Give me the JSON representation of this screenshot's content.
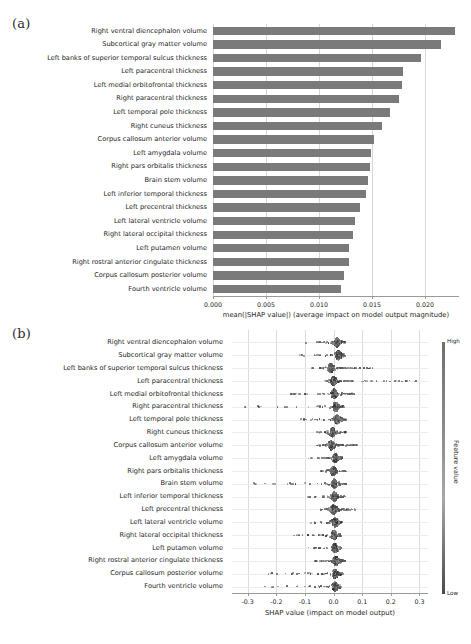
{
  "figure": {
    "panel_a_tag": "(a)",
    "panel_b_tag": "(b)"
  },
  "chart_data": [
    {
      "type": "bar",
      "panel": "(a)",
      "orientation": "horizontal",
      "title": "",
      "xlabel": "mean(|SHAP value|) (average impact on model output magnitude)",
      "ylabel": "",
      "xlim": [
        0.0,
        0.0232
      ],
      "xticks": [
        0.0,
        0.005,
        0.01,
        0.015,
        0.02
      ],
      "xtick_labels": [
        "0.000",
        "0.005",
        "0.010",
        "0.015",
        "0.020"
      ],
      "grid": true,
      "bar_color": "#7a7a7a",
      "categories": [
        "Right ventral diencephalon volume",
        "Subcortical gray matter volume",
        "Left banks of superior temporal sulcus thickness",
        "Left paracentral thickness",
        "Left medial orbitofrontal thickness",
        "Right paracentral thickness",
        "Left temporal pole thickness",
        "Right cuneus thickness",
        "Corpus callosum anterior volume",
        "Left amygdala volume",
        "Right pars orbitalis thickness",
        "Brain stem volume",
        "Left inferior temporal thickness",
        "Left precentral thickness",
        "Left lateral ventricle volume",
        "Right lateral occipital thickness",
        "Left putamen volume",
        "Right rostral anterior cingulate thickness",
        "Corpus callosum posterior volume",
        "Fourth ventricle volume"
      ],
      "values": [
        0.0228,
        0.0215,
        0.0196,
        0.0179,
        0.0178,
        0.0175,
        0.0167,
        0.0159,
        0.0152,
        0.0149,
        0.0148,
        0.0146,
        0.0144,
        0.0139,
        0.0134,
        0.0132,
        0.0128,
        0.0128,
        0.0124,
        0.0121
      ]
    },
    {
      "type": "scatter",
      "panel": "(b)",
      "plot_kind": "beeswarm",
      "title": "",
      "xlabel": "SHAP value (impact on model output)",
      "ylabel": "",
      "xlim": [
        -0.355,
        0.33
      ],
      "xticks": [
        -0.3,
        -0.2,
        -0.1,
        0.0,
        0.1,
        0.2,
        0.3
      ],
      "xtick_labels": [
        "-0.3",
        "-0.2",
        "-0.1",
        "0.0",
        "0.1",
        "0.2",
        "0.3"
      ],
      "grid": true,
      "colorbar": {
        "label": "Feature value",
        "high_label": "High",
        "low_label": "Low",
        "high_color": "#6f6f6f",
        "low_color": "#4a4a4a"
      },
      "categories": [
        "Right ventral diencephalon volume",
        "Subcortical gray matter volume",
        "Left banks of superior temporal sulcus thickness",
        "Left paracentral thickness",
        "Left medial orbitofrontal thickness",
        "Right paracentral thickness",
        "Left temporal pole thickness",
        "Right cuneus thickness",
        "Corpus callosum anterior volume",
        "Left amygdala volume",
        "Right pars orbitalis thickness",
        "Brain stem volume",
        "Left inferior temporal thickness",
        "Left precentral thickness",
        "Left lateral ventricle volume",
        "Right lateral occipital thickness",
        "Left putamen volume",
        "Right rostral anterior cingulate thickness",
        "Corpus callosum posterior volume",
        "Fourth ventricle volume"
      ],
      "rows": [
        {
          "feature": "Right ventral diencephalon volume",
          "center": 0.012,
          "neg_tail": -0.145,
          "pos_tail": 0.042,
          "density_peak": 0.013
        },
        {
          "feature": "Subcortical gray matter volume",
          "center": 0.016,
          "neg_tail": -0.135,
          "pos_tail": 0.04,
          "density_peak": 0.017
        },
        {
          "feature": "Left banks of superior temporal sulcus thickness",
          "center": 0.002,
          "neg_tail": -0.082,
          "pos_tail": 0.14,
          "density_peak": -0.01
        },
        {
          "feature": "Left paracentral thickness",
          "center": 0.004,
          "neg_tail": -0.03,
          "pos_tail": 0.3,
          "density_peak": 0.0
        },
        {
          "feature": "Left medial orbitofrontal thickness",
          "center": 0.0,
          "neg_tail": -0.17,
          "pos_tail": 0.075,
          "density_peak": 0.002
        },
        {
          "feature": "Right paracentral thickness",
          "center": 0.006,
          "neg_tail": -0.33,
          "pos_tail": 0.038,
          "density_peak": 0.008
        },
        {
          "feature": "Left temporal pole thickness",
          "center": 0.01,
          "neg_tail": -0.118,
          "pos_tail": 0.046,
          "density_peak": 0.012
        },
        {
          "feature": "Right cuneus thickness",
          "center": -0.004,
          "neg_tail": -0.072,
          "pos_tail": 0.045,
          "density_peak": -0.004
        },
        {
          "feature": "Corpus callosum anterior volume",
          "center": 0.002,
          "neg_tail": -0.062,
          "pos_tail": 0.082,
          "density_peak": -0.008
        },
        {
          "feature": "Left amygdala volume",
          "center": 0.006,
          "neg_tail": -0.09,
          "pos_tail": 0.03,
          "density_peak": 0.006
        },
        {
          "feature": "Right pars orbitalis thickness",
          "center": -0.002,
          "neg_tail": -0.048,
          "pos_tail": 0.044,
          "density_peak": -0.002
        },
        {
          "feature": "Brain stem volume",
          "center": 0.0,
          "neg_tail": -0.32,
          "pos_tail": 0.048,
          "density_peak": 0.002
        },
        {
          "feature": "Left inferior temporal thickness",
          "center": 0.004,
          "neg_tail": -0.1,
          "pos_tail": 0.042,
          "density_peak": 0.004
        },
        {
          "feature": "Left precentral thickness",
          "center": 0.002,
          "neg_tail": -0.048,
          "pos_tail": 0.082,
          "density_peak": 0.0
        },
        {
          "feature": "Left lateral ventricle volume",
          "center": 0.004,
          "neg_tail": -0.082,
          "pos_tail": 0.03,
          "density_peak": 0.006
        },
        {
          "feature": "Right lateral occipital thickness",
          "center": 0.0,
          "neg_tail": -0.142,
          "pos_tail": 0.026,
          "density_peak": 0.002
        },
        {
          "feature": "Left putamen volume",
          "center": 0.004,
          "neg_tail": -0.09,
          "pos_tail": 0.028,
          "density_peak": 0.005
        },
        {
          "feature": "Right rostral anterior cingulate thickness",
          "center": 0.006,
          "neg_tail": -0.072,
          "pos_tail": 0.04,
          "density_peak": 0.008
        },
        {
          "feature": "Corpus callosum posterior volume",
          "center": 0.004,
          "neg_tail": -0.245,
          "pos_tail": 0.032,
          "density_peak": 0.005
        },
        {
          "feature": "Fourth ventricle volume",
          "center": 0.004,
          "neg_tail": -0.25,
          "pos_tail": 0.028,
          "density_peak": 0.005
        }
      ]
    }
  ]
}
